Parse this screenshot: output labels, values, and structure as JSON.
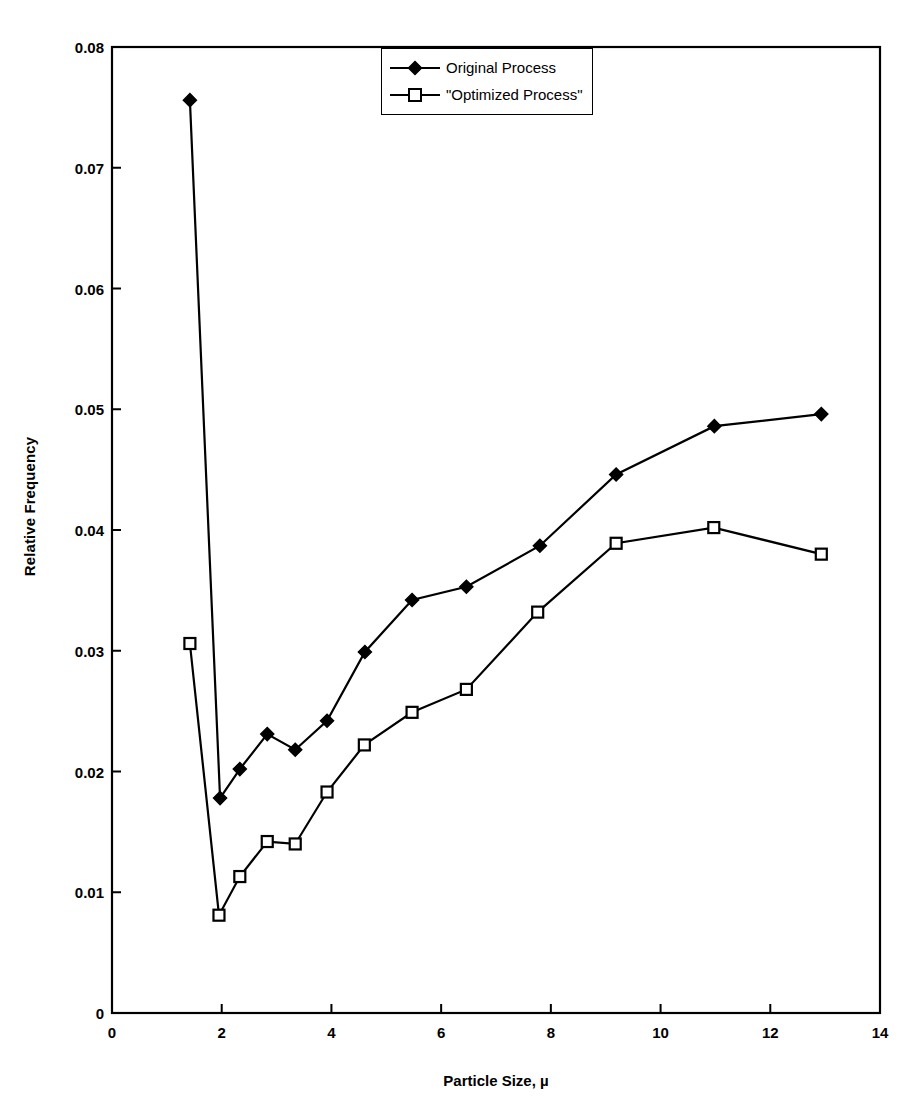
{
  "chart_data": {
    "type": "line",
    "title": "",
    "xlabel": "Particle Size, µ",
    "ylabel": "Relative Frequency",
    "xlim": [
      0,
      14
    ],
    "ylim": [
      0,
      0.08
    ],
    "xticks": [
      "0",
      "2",
      "4",
      "6",
      "8",
      "10",
      "12",
      "14"
    ],
    "xtick_values": [
      0,
      2,
      4,
      6,
      8,
      10,
      12,
      14
    ],
    "yticks": [
      "0",
      "0.01",
      "0.02",
      "0.03",
      "0.04",
      "0.05",
      "0.06",
      "0.07",
      "0.08"
    ],
    "ytick_values": [
      0,
      0.01,
      0.02,
      0.03,
      0.04,
      0.05,
      0.06,
      0.07,
      0.08
    ],
    "grid": false,
    "legend_position": "top-center",
    "series": [
      {
        "name": "Original Process",
        "marker": "filled-diamond",
        "color": "#000000",
        "x": [
          1.42,
          1.97,
          2.33,
          2.83,
          3.34,
          3.92,
          4.61,
          5.47,
          6.46,
          7.8,
          9.19,
          10.98,
          12.93
        ],
        "y": [
          0.0756,
          0.0178,
          0.0202,
          0.0231,
          0.0218,
          0.0242,
          0.0299,
          0.0342,
          0.0353,
          0.0387,
          0.0446,
          0.0486,
          0.0496
        ]
      },
      {
        "name": "\"Optimized Process\"",
        "marker": "open-square",
        "color": "#000000",
        "x": [
          1.42,
          1.95,
          2.33,
          2.83,
          3.34,
          3.92,
          4.6,
          5.47,
          6.46,
          7.76,
          9.19,
          10.97,
          12.93
        ],
        "y": [
          0.0306,
          0.0081,
          0.0113,
          0.0142,
          0.014,
          0.0183,
          0.0222,
          0.0249,
          0.0268,
          0.0332,
          0.0389,
          0.0402,
          0.038
        ]
      }
    ]
  },
  "legend": {
    "items": [
      {
        "label": "Original Process",
        "marker": "filled-diamond"
      },
      {
        "label": "\"Optimized Process\"",
        "marker": "open-square"
      }
    ]
  }
}
